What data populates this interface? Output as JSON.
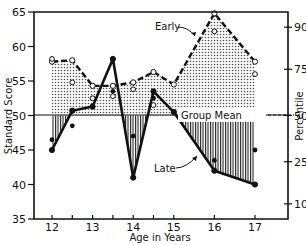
{
  "chart_data": {
    "type": "line",
    "title": "",
    "xlabel": "Age in Years",
    "ylabel": "Standard Score",
    "y2label": "Percentile",
    "xlim": [
      11.75,
      17.5
    ],
    "ylim": [
      35,
      65
    ],
    "x_ticks": [
      12,
      12.5,
      13,
      13.5,
      14,
      14.5,
      15,
      16,
      17
    ],
    "x_tick_labels": [
      "12",
      "13",
      "14",
      "15",
      "16",
      "17"
    ],
    "y_ticks": [
      35,
      40,
      45,
      50,
      55,
      60,
      65
    ],
    "y2_ticks": [
      {
        "label": "90",
        "score": 62.8
      },
      {
        "label": "75",
        "score": 56.7
      },
      {
        "label": "50",
        "score": 50
      },
      {
        "label": "25",
        "score": 43.3
      },
      {
        "label": "10",
        "score": 37.2
      }
    ],
    "reference_line": {
      "label": "Group Mean",
      "value": 50
    },
    "grid": false,
    "legend": "inline annotations",
    "series": [
      {
        "name": "Early",
        "style": "dashed, open circles, dotted fill above mean",
        "x": [
          12,
          12.5,
          13,
          13.5,
          14,
          14.5,
          15,
          16,
          17
        ],
        "values": [
          57.8,
          58,
          54.3,
          54.3,
          54.8,
          56.3,
          54.5,
          64.8,
          57.8
        ]
      },
      {
        "name": "Late",
        "style": "solid, filled circles, vertical hatch below mean",
        "x": [
          12,
          12.5,
          13,
          13.5,
          14,
          14.5,
          15,
          16,
          17
        ],
        "values": [
          45,
          50.7,
          51.3,
          58.2,
          41,
          53.5,
          50.5,
          42,
          40
        ]
      }
    ],
    "scatter_extra": {
      "open": [
        {
          "x": 12,
          "y": 58.2
        },
        {
          "x": 12.5,
          "y": 54.8
        },
        {
          "x": 13,
          "y": 52.5
        },
        {
          "x": 13.5,
          "y": 52.8
        },
        {
          "x": 14,
          "y": 53.8
        },
        {
          "x": 14.5,
          "y": 51.5
        },
        {
          "x": 16,
          "y": 62.2
        },
        {
          "x": 17,
          "y": 56
        }
      ],
      "filled": [
        {
          "x": 12,
          "y": 46.5
        },
        {
          "x": 12.5,
          "y": 48.5
        },
        {
          "x": 13.5,
          "y": 53.5
        },
        {
          "x": 14,
          "y": 47
        },
        {
          "x": 14.5,
          "y": 52.5
        },
        {
          "x": 16,
          "y": 43.5
        },
        {
          "x": 17,
          "y": 45
        }
      ]
    },
    "annotations": [
      "Early",
      "Late",
      "Group Mean"
    ]
  },
  "labels": {
    "ylabel": "Standard Score",
    "y2label": "Percentile",
    "xlabel": "Age in Years",
    "early": "Early",
    "late": "Late",
    "group_mean": "Group Mean"
  }
}
